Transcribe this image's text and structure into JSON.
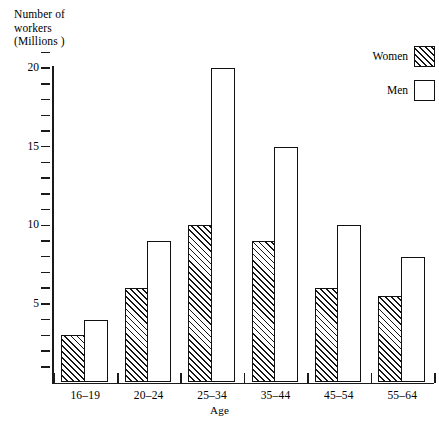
{
  "chart_data": {
    "type": "bar",
    "title": "",
    "ylabel": "Number of\nworkers\n(Millions )",
    "ylabel_lines": [
      "Number of",
      "workers",
      "(Millions )"
    ],
    "xlabel": "Age",
    "categories": [
      "16–19",
      "20–24",
      "25–34",
      "35–44",
      "45–54",
      "55–64"
    ],
    "series": [
      {
        "name": "Women",
        "pattern": "diagonal-hatch",
        "values": [
          3,
          6,
          10,
          9,
          6,
          5.5
        ]
      },
      {
        "name": "Men",
        "pattern": "open",
        "values": [
          4,
          9,
          20,
          15,
          10,
          8
        ]
      }
    ],
    "ylim": [
      0,
      21
    ],
    "ytick_values": [
      5,
      10,
      15,
      20
    ],
    "ytick_labels": [
      "5",
      "10",
      "15",
      "20"
    ],
    "yminor_step": 1,
    "grid": false,
    "legend_position": "top-right",
    "axis_color": "#1a1a1a",
    "bar_edge_color": "#111111",
    "bar_fill_color": "#ffffff",
    "hatch_color": "#151515"
  },
  "legend": {
    "entries": [
      {
        "label": "Women",
        "swatch": "hatched-swatch"
      },
      {
        "label": "Men",
        "swatch": "open-swatch"
      }
    ]
  }
}
